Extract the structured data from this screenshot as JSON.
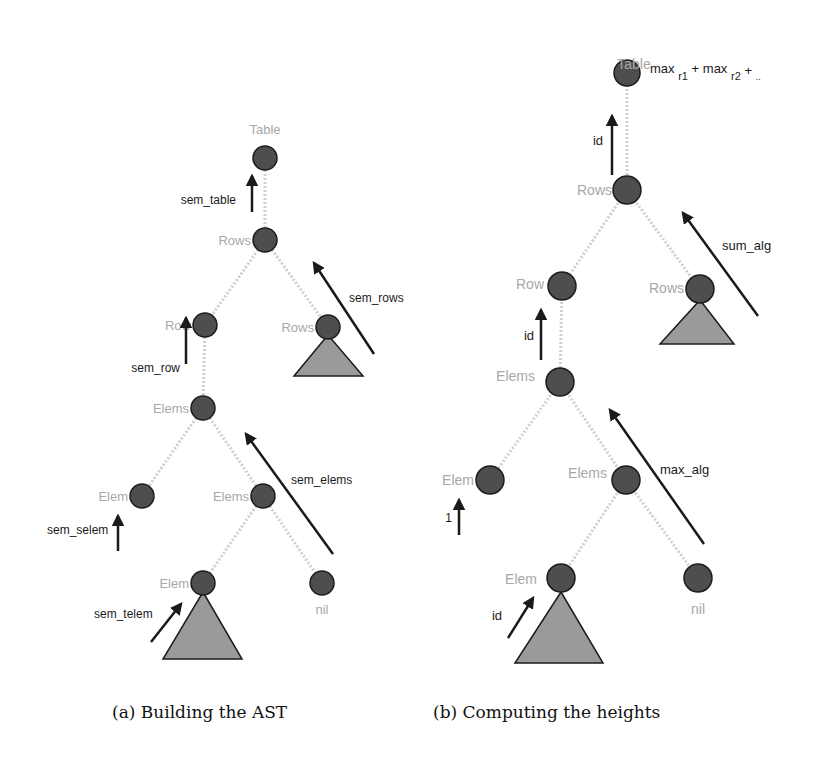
{
  "figure": {
    "panels": [
      {
        "id": "a",
        "caption": "(a) Building the AST",
        "nodes": {
          "table": "Table",
          "rows": "Rows",
          "row": "Row",
          "rows_right": "Rows",
          "elems": "Elems",
          "elem_left": "Elem",
          "elems_right": "Elems",
          "elem_bottom": "Elem",
          "nil": "nil"
        },
        "arrows": {
          "sem_table": "sem_table",
          "sem_rows": "sem_rows",
          "sem_row": "sem_row",
          "sem_elems": "sem_elems",
          "sem_selem": "sem_selem",
          "sem_telem": "sem_telem"
        }
      },
      {
        "id": "b",
        "caption": "(b) Computing the heights",
        "nodes": {
          "table": "Table",
          "rows": "Rows",
          "row": "Row",
          "rows_right": "Rows",
          "elems": "Elems",
          "elem_left": "Elem",
          "elems_right": "Elems",
          "elem_bottom": "Elem",
          "nil": "nil"
        },
        "root_formula": {
          "max1": "max",
          "sub1": "r1",
          "plus1": "+",
          "max2": "max",
          "sub2": "r2",
          "plus2": "+",
          "ellipsis": ".."
        },
        "arrows": {
          "id_table": "id",
          "sum_alg": "sum_alg",
          "id_row": "id",
          "max_alg": "max_alg",
          "one": "1",
          "id_elem": "id"
        }
      }
    ]
  }
}
